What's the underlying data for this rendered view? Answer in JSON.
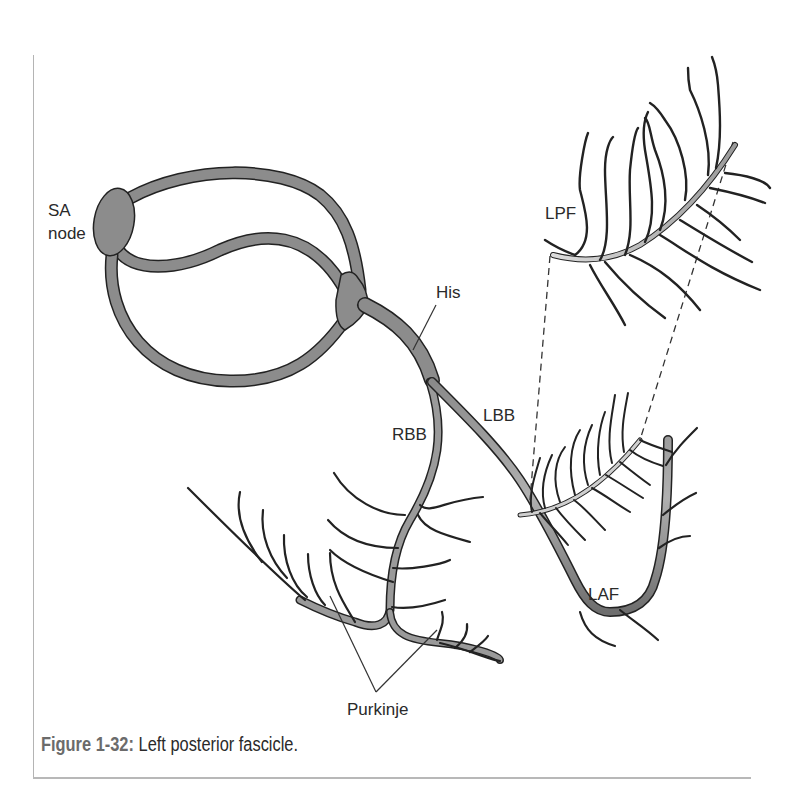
{
  "figure": {
    "number_label": "Figure 1-32:",
    "caption_text": "Left posterior fascicle."
  },
  "labels": {
    "sa_node_line1": "SA",
    "sa_node_line2": "node",
    "his": "His",
    "rbb": "RBB",
    "lbb": "LBB",
    "lpf": "LPF",
    "laf": "LAF",
    "purkinje": "Purkinje"
  },
  "colors": {
    "conduction_fill": "#8c8c8c",
    "conduction_light": "#c8c8c8",
    "outline": "#222222",
    "label_text": "#2a2a2a",
    "caption_number": "#6b6b6b",
    "frame_line": "#b4b4b4"
  }
}
